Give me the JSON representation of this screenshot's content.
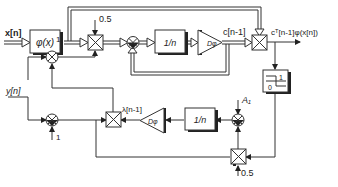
{
  "diagram": {
    "type": "block-diagram",
    "signals": {
      "input_x": "x[n]",
      "input_y": "y[n]",
      "c_prev": "c[n-1]",
      "output": "cᵀ[n-1]φ(x[n])",
      "lambda_prev": "λ[n-1]"
    },
    "blocks": {
      "phi": "φ(x)",
      "inv_n_top": "1/n",
      "delay_top": "Dφ",
      "inv_n_bottom": "1/n",
      "delay_bottom": "Dφ",
      "threshold_hi": "1",
      "threshold_lo": "0"
    },
    "constants": {
      "gain_top": "0.5",
      "one_upper": "1",
      "one_lower": "1",
      "a1": "A₁",
      "gain_bottom": "0.5"
    }
  }
}
